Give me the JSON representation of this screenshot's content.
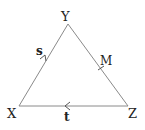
{
  "diagram": {
    "colors": {
      "line": "#8a8a8a",
      "text": "#222222",
      "background": "#ffffff"
    },
    "vertices": {
      "X": {
        "label": "X",
        "x": 19,
        "y": 106
      },
      "Y": {
        "label": "Y",
        "x": 68,
        "y": 24
      },
      "Z": {
        "label": "Z",
        "x": 128,
        "y": 106
      }
    },
    "points": {
      "M": {
        "label": "M",
        "on_segment": "YZ",
        "note": "midpoint tick mark"
      }
    },
    "vectors": [
      {
        "label": "s",
        "from": "X",
        "to": "Y",
        "arrow": "toward-Y"
      },
      {
        "label": "t",
        "from": "Z",
        "to": "X",
        "arrow": "toward-X"
      }
    ]
  }
}
